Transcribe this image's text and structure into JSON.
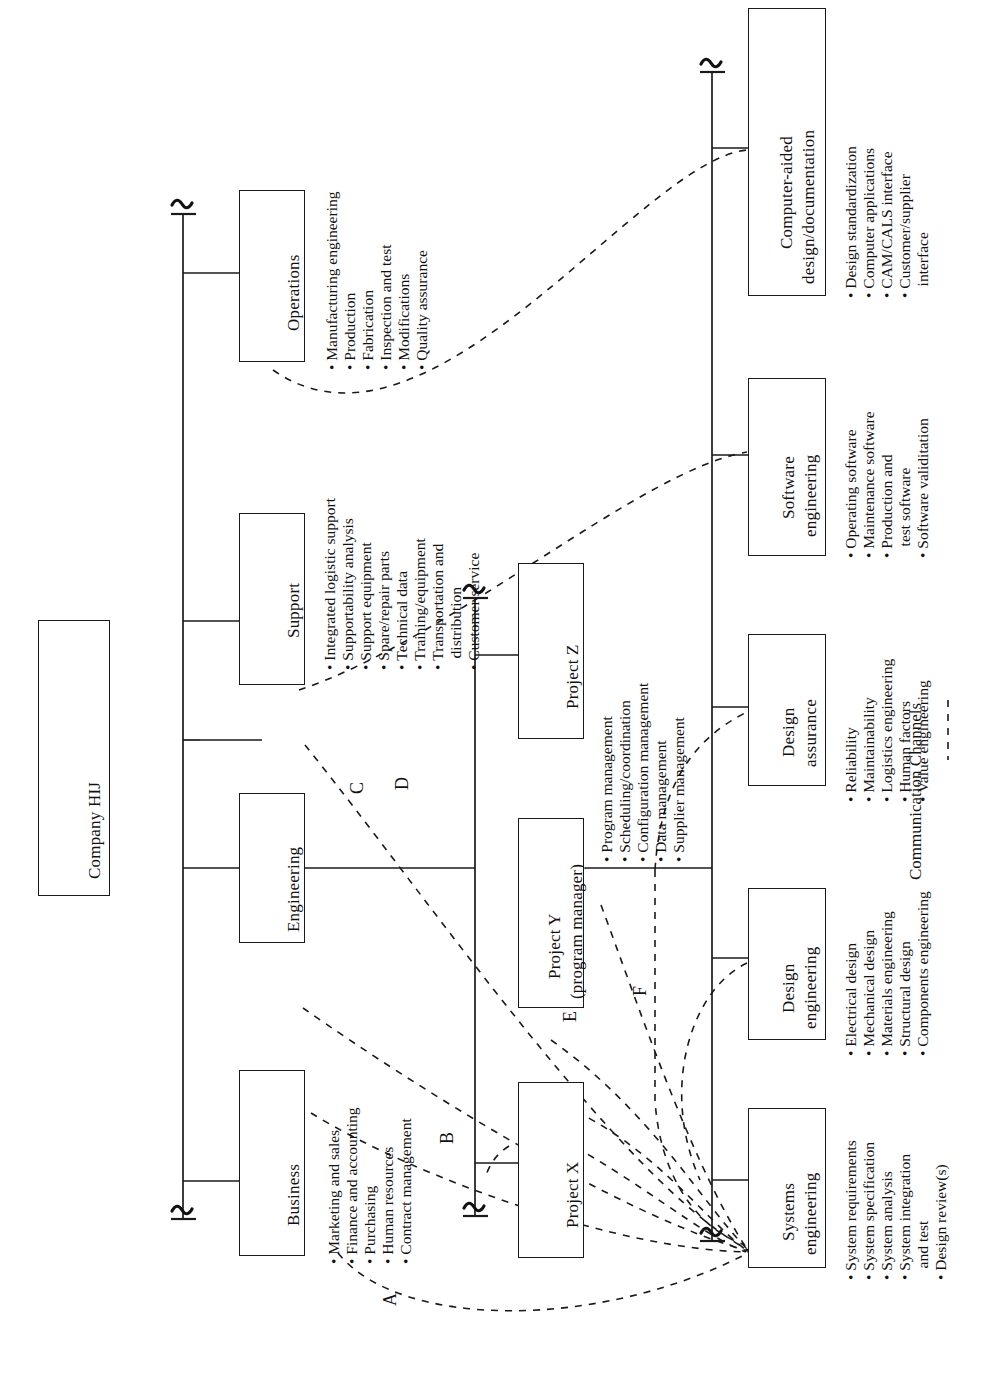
{
  "diagram": {
    "root": {
      "label": "Company HIJ"
    },
    "level2": [
      {
        "label": "Business",
        "bullets": [
          "Marketing and sales",
          "Finance and accounting",
          "Purchasing",
          "Human resources",
          "Contract management"
        ]
      },
      {
        "label": "Engineering",
        "bullets": []
      },
      {
        "label": "Support",
        "bullets": [
          "Integrated logistic support",
          "Supportability analysis",
          "Support equipment",
          "Spare/repair parts",
          "Technical data",
          "Training/equipment",
          "Transportation and",
          "distribution",
          "Customer service"
        ]
      },
      {
        "label": "Operations",
        "bullets": [
          "Manufacturing engineering",
          "Production",
          "Fabrication",
          "Inspection and test",
          "Modifications",
          "Quality assurance"
        ]
      }
    ],
    "projects": [
      {
        "label": "Project X",
        "sublabel": "",
        "bullets": []
      },
      {
        "label": "Project Y",
        "sublabel": "(program manager)",
        "bullets": [
          "Program management",
          "Scheduling/coordination",
          "Configuration management",
          "Data management",
          "Supplier management"
        ]
      },
      {
        "label": "Project Z",
        "sublabel": "",
        "bullets": []
      }
    ],
    "functions": [
      {
        "label": "Systems",
        "sublabel": "engineering",
        "bullets": [
          "System requirements",
          "System specification",
          "System analysis",
          "System integration",
          "and test",
          "Design review(s)"
        ]
      },
      {
        "label": "Design",
        "sublabel": "engineering",
        "bullets": [
          "Electrical design",
          "Mechanical design",
          "Materials engineering",
          "Structural design",
          "Components engineering"
        ]
      },
      {
        "label": "Design",
        "sublabel": "assurance",
        "bullets": [
          "Reliability",
          "Maintainability",
          "Logistics engineering",
          "Human factors",
          "Value engineering"
        ]
      },
      {
        "label": "Software",
        "sublabel": "engineering",
        "bullets": [
          "Operating software",
          "Maintenance software",
          "Production and",
          "test software",
          "Software validitation"
        ]
      },
      {
        "label": "Computer-aided",
        "sublabel": "design/documentation",
        "bullets": [
          "Design standardization",
          "Computer applications",
          "CAM/CALS interface",
          "Customer/supplier",
          "interface"
        ]
      }
    ],
    "channels": [
      {
        "id": "A"
      },
      {
        "id": "B"
      },
      {
        "id": "C"
      },
      {
        "id": "D"
      },
      {
        "id": "E"
      },
      {
        "id": "F"
      }
    ],
    "legend": {
      "label": "Communication Channels"
    }
  }
}
